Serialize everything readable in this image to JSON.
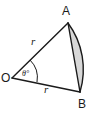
{
  "figure": {
    "kind": "circular-sector-with-shaded-segment",
    "background_color": "#ffffff",
    "stroke_color": "#1a1a1a",
    "segment_fill_color": "#d8d8d8",
    "vertices": {
      "center_label": "O",
      "arc_start_label": "A",
      "arc_end_label": "B"
    },
    "measures": {
      "radius_upper_label": "r",
      "radius_lower_label": "r",
      "angle_label": "θ°"
    }
  },
  "geometry": {
    "center": {
      "x": 12,
      "y": 78
    },
    "point_a": {
      "x": 68,
      "y": 23
    },
    "point_b": {
      "x": 80,
      "y": 92
    },
    "radius_px": 78,
    "arc_bulge_x": 93
  }
}
